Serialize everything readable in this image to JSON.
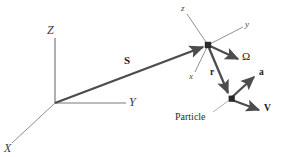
{
  "figure": {
    "background_color": "#ffffff",
    "width": 286,
    "height": 157
  },
  "colors": {
    "thin_axis": "#6e6e6e",
    "thick_vector": "#4d4d4d",
    "node": "#2a2a2a",
    "label": "#2b2b2b",
    "leader": "#8a8a8a"
  },
  "global_frame": {
    "origin_label": "",
    "axes": [
      {
        "name": "Z",
        "label": "Z",
        "direction": "up"
      },
      {
        "name": "Y",
        "label": "Y",
        "direction": "right"
      },
      {
        "name": "X",
        "label": "X",
        "direction": "down-left"
      }
    ]
  },
  "body_frame": {
    "axes": [
      {
        "name": "z",
        "label": "z",
        "direction": "up-left"
      },
      {
        "name": "y",
        "label": "y",
        "direction": "up-right"
      },
      {
        "name": "x",
        "label": "x",
        "direction": "down-left"
      }
    ]
  },
  "vectors": [
    {
      "name": "S",
      "label": "S",
      "description": "position of satellite from global origin",
      "style": "thick"
    },
    {
      "name": "r",
      "label": "r",
      "description": "position of particle relative to satellite",
      "style": "thick"
    },
    {
      "name": "Omega",
      "label": "Ω",
      "description": "angular velocity of body frame",
      "style": "thick"
    },
    {
      "name": "a",
      "label": "a",
      "description": "acceleration of particle",
      "style": "thick"
    },
    {
      "name": "V",
      "label": "V",
      "description": "velocity of particle",
      "style": "thick"
    }
  ],
  "annotations": [
    {
      "name": "particle",
      "label": "Particle",
      "has_leader_line": true
    }
  ],
  "nodes": [
    {
      "name": "satellite-node",
      "label": ""
    },
    {
      "name": "particle-node",
      "label": ""
    }
  ]
}
